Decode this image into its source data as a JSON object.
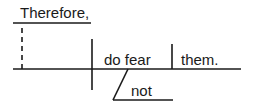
{
  "diagram": {
    "type": "sentence-diagram",
    "sentence": "Therefore, do not fear them.",
    "words": {
      "conjunctive_adverb": "Therefore,",
      "verb": "do fear",
      "modifier": "not",
      "direct_object": "them."
    },
    "colors": {
      "line": "#1a1a1a",
      "background": "#ffffff"
    }
  }
}
